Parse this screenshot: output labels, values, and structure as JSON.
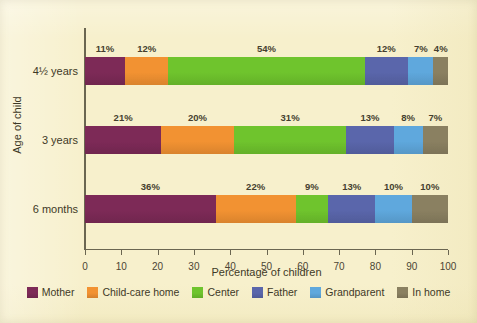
{
  "chart_data": {
    "type": "bar",
    "orientation": "horizontal",
    "stacked": true,
    "title": "",
    "xlabel": "Percentage of children",
    "ylabel": "Age of child",
    "xlim": [
      0,
      100
    ],
    "xticks": [
      0,
      10,
      20,
      30,
      40,
      50,
      60,
      70,
      80,
      90,
      100
    ],
    "xtick_labels": [
      "0",
      "10",
      "20",
      "30",
      "40",
      "50",
      "60",
      "70",
      "80",
      "90",
      "100"
    ],
    "grid": false,
    "legend_position": "bottom",
    "categories": [
      "6 months",
      "3 years",
      "4½ years"
    ],
    "series": [
      {
        "name": "Mother",
        "color": "#7d2a57",
        "values": [
          36,
          21,
          11
        ]
      },
      {
        "name": "Child-care home",
        "color": "#f29232",
        "values": [
          22,
          20,
          12
        ]
      },
      {
        "name": "Center",
        "color": "#6fc42d",
        "values": [
          9,
          31,
          54
        ]
      },
      {
        "name": "Father",
        "color": "#5a66ab",
        "values": [
          13,
          13,
          12
        ]
      },
      {
        "name": "Grandparent",
        "color": "#5fa8dd",
        "values": [
          10,
          8,
          7
        ]
      },
      {
        "name": "In home",
        "color": "#8a8061",
        "values": [
          10,
          7,
          4
        ]
      }
    ],
    "rows": [
      {
        "category": "4½ years",
        "segments": [
          {
            "series": "Mother",
            "value": 11,
            "label": "11%",
            "color": "#7d2a57"
          },
          {
            "series": "Child-care home",
            "value": 12,
            "label": "12%",
            "color": "#f29232"
          },
          {
            "series": "Center",
            "value": 54,
            "label": "54%",
            "color": "#6fc42d"
          },
          {
            "series": "Father",
            "value": 12,
            "label": "12%",
            "color": "#5a66ab"
          },
          {
            "series": "Grandparent",
            "value": 7,
            "label": "7%",
            "color": "#5fa8dd"
          },
          {
            "series": "In home",
            "value": 4,
            "label": "4%",
            "color": "#8a8061"
          }
        ]
      },
      {
        "category": "3 years",
        "segments": [
          {
            "series": "Mother",
            "value": 21,
            "label": "21%",
            "color": "#7d2a57"
          },
          {
            "series": "Child-care home",
            "value": 20,
            "label": "20%",
            "color": "#f29232"
          },
          {
            "series": "Center",
            "value": 31,
            "label": "31%",
            "color": "#6fc42d"
          },
          {
            "series": "Father",
            "value": 13,
            "label": "13%",
            "color": "#5a66ab"
          },
          {
            "series": "Grandparent",
            "value": 8,
            "label": "8%",
            "color": "#5fa8dd"
          },
          {
            "series": "In home",
            "value": 7,
            "label": "7%",
            "color": "#8a8061"
          }
        ]
      },
      {
        "category": "6 months",
        "segments": [
          {
            "series": "Mother",
            "value": 36,
            "label": "36%",
            "color": "#7d2a57"
          },
          {
            "series": "Child-care home",
            "value": 22,
            "label": "22%",
            "color": "#f29232"
          },
          {
            "series": "Center",
            "value": 9,
            "label": "9%",
            "color": "#6fc42d"
          },
          {
            "series": "Father",
            "value": 13,
            "label": "13%",
            "color": "#5a66ab"
          },
          {
            "series": "Grandparent",
            "value": 10,
            "label": "10%",
            "color": "#5fa8dd"
          },
          {
            "series": "In home",
            "value": 10,
            "label": "10%",
            "color": "#8a8061"
          }
        ]
      }
    ],
    "legend": [
      {
        "label": "Mother",
        "color": "#7d2a57"
      },
      {
        "label": "Child-care home",
        "color": "#f29232"
      },
      {
        "label": "Center",
        "color": "#6fc42d"
      },
      {
        "label": "Father",
        "color": "#5a66ab"
      },
      {
        "label": "Grandparent",
        "color": "#5fa8dd"
      },
      {
        "label": "In home",
        "color": "#8a8061"
      }
    ]
  },
  "figure": {
    "background_color": "#f7f0cc",
    "axis_color": "#6b6651",
    "text_color": "#3e3927"
  }
}
